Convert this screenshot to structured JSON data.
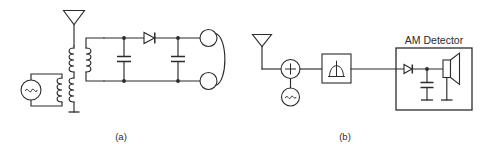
{
  "figure": {
    "background_color": "#ffffff",
    "line_color": "#2b2b2b",
    "width": 480,
    "height": 153
  },
  "panels": [
    {
      "id": "panel-a",
      "caption": "(a)",
      "title": "",
      "description": "Crystal radio receiver: antenna, tuned transformer with AC source, tuning capacitor, detector diode, filter capacitor and headphones",
      "components": [
        {
          "name": "antenna",
          "symbol": "antenna-triangle",
          "label": ""
        },
        {
          "name": "ground",
          "symbol": "ground",
          "label": ""
        },
        {
          "name": "ac-source",
          "symbol": "ac-source-sine",
          "label": "~"
        },
        {
          "name": "transformer-upper",
          "symbol": "transformer-coils",
          "label": ""
        },
        {
          "name": "transformer-lower",
          "symbol": "transformer-coils",
          "label": ""
        },
        {
          "name": "capacitor-tuning",
          "symbol": "capacitor",
          "label": ""
        },
        {
          "name": "diode-detector",
          "symbol": "diode",
          "label": ""
        },
        {
          "name": "capacitor-filter",
          "symbol": "capacitor",
          "label": ""
        },
        {
          "name": "headphones",
          "symbol": "headphone-pair",
          "label": ""
        }
      ]
    },
    {
      "id": "panel-b",
      "caption": "(b)",
      "title": "AM Detector",
      "description": "Superheterodyne front end: antenna, mixer summing junction, local oscillator, bandpass filter, and AM detector block with diode, capacitor and speaker",
      "components": [
        {
          "name": "antenna",
          "symbol": "antenna-triangle",
          "label": ""
        },
        {
          "name": "mixer",
          "symbol": "summing-junction-plus",
          "label": "+"
        },
        {
          "name": "local-oscillator",
          "symbol": "ac-source-sine",
          "label": "~"
        },
        {
          "name": "bandpass-filter",
          "symbol": "filter-box-arch",
          "label": ""
        },
        {
          "name": "diode-detector",
          "symbol": "diode",
          "label": ""
        },
        {
          "name": "capacitor-filter",
          "symbol": "capacitor",
          "label": ""
        },
        {
          "name": "speaker",
          "symbol": "speaker",
          "label": ""
        },
        {
          "name": "ground-capacitor",
          "symbol": "ground",
          "label": ""
        },
        {
          "name": "ground-speaker",
          "symbol": "ground",
          "label": ""
        }
      ]
    }
  ]
}
